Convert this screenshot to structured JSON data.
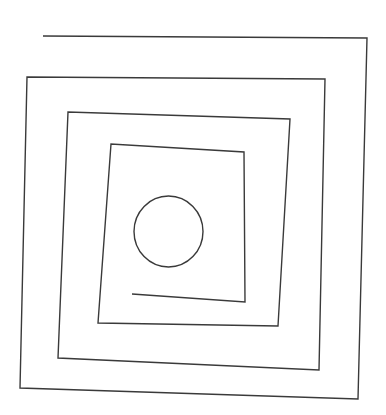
{
  "diagram": {
    "type": "square-spiral-with-center-circle",
    "background": "#ffffff",
    "stroke_color": "#3a3a3a",
    "stroke_width": 1.4,
    "spiral_points": [
      [
        43,
        36
      ],
      [
        367,
        38
      ],
      [
        358,
        399
      ],
      [
        20,
        388
      ],
      [
        27,
        77
      ],
      [
        325,
        79
      ],
      [
        319,
        370
      ],
      [
        58,
        358
      ],
      [
        68,
        112
      ],
      [
        290,
        119
      ],
      [
        278,
        326
      ],
      [
        98,
        323
      ],
      [
        111,
        144
      ],
      [
        244,
        152
      ],
      [
        245,
        302
      ],
      [
        132,
        294
      ]
    ],
    "circle": {
      "cx": 168.5,
      "cy": 231.5,
      "rx": 34.5,
      "ry": 35.5
    }
  }
}
